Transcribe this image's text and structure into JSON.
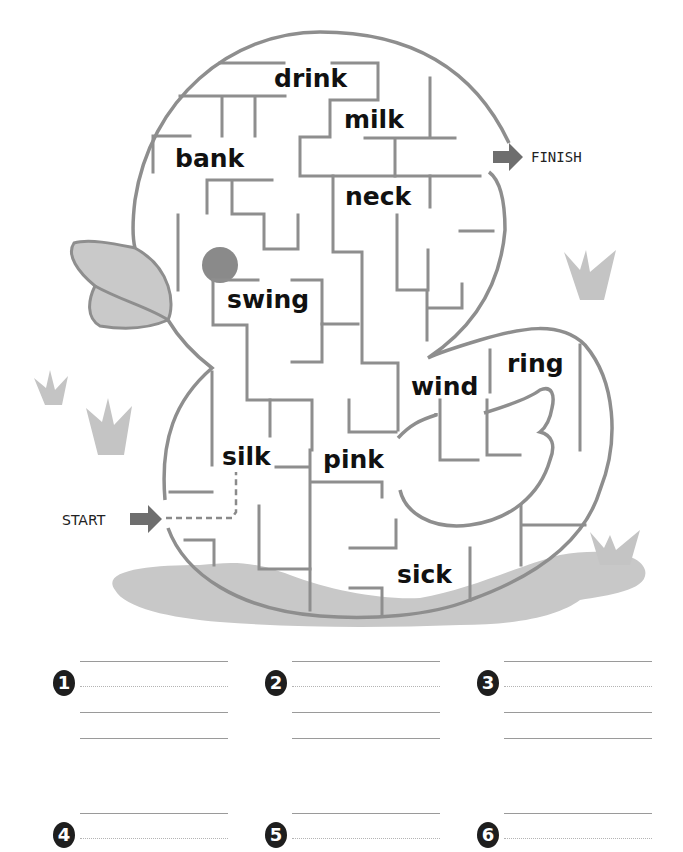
{
  "worksheet": {
    "start_label": "START",
    "finish_label": "FINISH",
    "maze_words": [
      {
        "id": "drink",
        "text": "drink"
      },
      {
        "id": "milk",
        "text": "milk"
      },
      {
        "id": "bank",
        "text": "bank"
      },
      {
        "id": "neck",
        "text": "neck"
      },
      {
        "id": "swing",
        "text": "swing"
      },
      {
        "id": "ring",
        "text": "ring"
      },
      {
        "id": "wind",
        "text": "wind"
      },
      {
        "id": "silk",
        "text": "silk"
      },
      {
        "id": "pink",
        "text": "pink"
      },
      {
        "id": "sick",
        "text": "sick"
      }
    ],
    "answer_slots": [
      {
        "number": "1",
        "value": ""
      },
      {
        "number": "2",
        "value": ""
      },
      {
        "number": "3",
        "value": ""
      },
      {
        "number": "4",
        "value": ""
      },
      {
        "number": "5",
        "value": ""
      },
      {
        "number": "6",
        "value": ""
      }
    ],
    "colors": {
      "wall": "#8e8e8e",
      "beak": "#c9c9c9",
      "eye": "#8a8a8a",
      "grass": "#c4c4c4",
      "puddle": "#c8c8c8",
      "arrow": "#6e6e6e",
      "text": "#111111"
    }
  }
}
